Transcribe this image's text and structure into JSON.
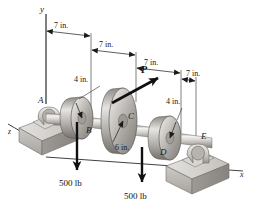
{
  "figure": {
    "background": "#ffffff",
    "ink": "#1a1a1a"
  },
  "axes": {
    "y_label": "y",
    "x_label": "x",
    "z_label": "z"
  },
  "dimensions": {
    "segments": [
      {
        "id": "A-B",
        "label": "7 in."
      },
      {
        "id": "B-C",
        "label": "7 in."
      },
      {
        "id": "C-D",
        "label": "7 in."
      },
      {
        "id": "D-E",
        "label": "7 in."
      }
    ],
    "radii": [
      {
        "id": "pulley-B-radius",
        "label": "4 in."
      },
      {
        "id": "pulley-C-radius",
        "label": "6 in."
      },
      {
        "id": "pulley-D-radius",
        "label": "4 in."
      }
    ]
  },
  "points": {
    "bearing_A": "A",
    "pulley_B": "B",
    "pulley_C": "C",
    "pulley_D": "D",
    "bearing_E": "E"
  },
  "forces": [
    {
      "id": "force-P",
      "label": "P",
      "direction": "up-right",
      "applied_at": "C"
    },
    {
      "id": "load-B",
      "label": "500 lb",
      "direction": "down",
      "applied_at": "B"
    },
    {
      "id": "load-D",
      "label": "500 lb",
      "direction": "down",
      "applied_at": "D"
    }
  ],
  "colors": {
    "shaft_light": "#f0efee",
    "shaft_mid": "#bdbab6",
    "shaft_dark": "#8e8b87",
    "pulley_light": "#e8e7e5",
    "pulley_mid": "#a8a5a1",
    "pulley_dark": "#74716d",
    "base_light": "#dedcd9",
    "base_mid": "#b4b1ad",
    "base_dark": "#8a8783",
    "arrow": "#141414",
    "line": "#2b2b2b"
  }
}
